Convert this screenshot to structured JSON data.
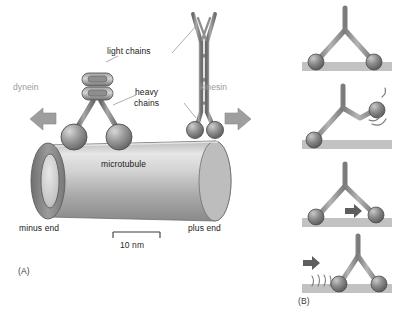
{
  "figure": {
    "panel_a": {
      "letter": "(A)",
      "labels": {
        "light_chains": "light chains",
        "heavy_chains_line1": "heavy",
        "heavy_chains_line2": "chains",
        "dynein": "dynein",
        "kinesin": "kinesin",
        "microtubule": "microtubule",
        "minus_end": "minus end",
        "plus_end": "plus end",
        "scale_bar": "10 nm"
      },
      "icons": {
        "minus_direction": "left-arrow-icon",
        "plus_direction": "right-arrow-icon",
        "scale": "scale-bar-icon"
      }
    },
    "panel_b": {
      "letter": "(B)",
      "frames": [
        {
          "name": "frame-both-heads-bound",
          "icons": []
        },
        {
          "name": "frame-rear-head-released",
          "icons": [
            "motion-arc-icon"
          ]
        },
        {
          "name": "frame-head-swings-forward",
          "icons": [
            "right-arrow-icon"
          ]
        },
        {
          "name": "frame-head-rebinds-ahead",
          "icons": [
            "right-arrow-icon",
            "vibration-lines-icon"
          ]
        }
      ]
    },
    "colors": {
      "motor_gray": "#8c8c8c",
      "motor_dark": "#5e5e5e",
      "track_gray": "#c2c2c2",
      "label_gray": "#9a9a9a",
      "ink": "#1a1a1a",
      "leader_line": "#8a8a8a"
    }
  }
}
